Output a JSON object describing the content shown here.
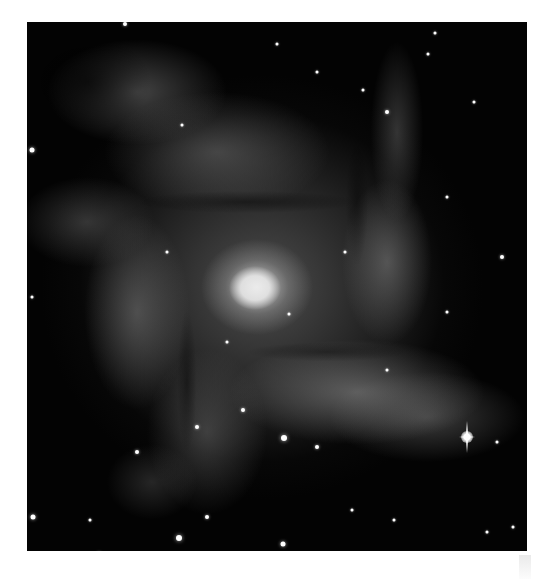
{
  "image": {
    "subject": "spiral galaxy (grayscale astronomical photograph)",
    "colors": {
      "background": "#ffffff",
      "sky": "#030303",
      "core": "#ffffff",
      "arms": "#8c8c8c"
    },
    "frame": {
      "x": 27,
      "y": 22,
      "width": 500,
      "height": 529
    },
    "core_center": {
      "x": 228,
      "y": 266
    },
    "bright_star": {
      "x": 440,
      "y": 415
    },
    "stars": [
      {
        "x": 98,
        "y": 2,
        "r": 2
      },
      {
        "x": 5,
        "y": 128,
        "r": 2.5
      },
      {
        "x": 155,
        "y": 103,
        "r": 1.5
      },
      {
        "x": 250,
        "y": 22,
        "r": 1.5
      },
      {
        "x": 408,
        "y": 11,
        "r": 1.5
      },
      {
        "x": 401,
        "y": 32,
        "r": 1.5
      },
      {
        "x": 336,
        "y": 68,
        "r": 1.5
      },
      {
        "x": 360,
        "y": 90,
        "r": 2
      },
      {
        "x": 290,
        "y": 50,
        "r": 1.5
      },
      {
        "x": 475,
        "y": 235,
        "r": 2
      },
      {
        "x": 5,
        "y": 275,
        "r": 1.5
      },
      {
        "x": 110,
        "y": 430,
        "r": 2
      },
      {
        "x": 170,
        "y": 405,
        "r": 2
      },
      {
        "x": 216,
        "y": 388,
        "r": 2
      },
      {
        "x": 257,
        "y": 416,
        "r": 3
      },
      {
        "x": 6,
        "y": 495,
        "r": 2.5
      },
      {
        "x": 63,
        "y": 498,
        "r": 1.5
      },
      {
        "x": 72,
        "y": 532,
        "r": 2
      },
      {
        "x": 152,
        "y": 516,
        "r": 3
      },
      {
        "x": 256,
        "y": 522,
        "r": 2.5
      },
      {
        "x": 180,
        "y": 495,
        "r": 2
      },
      {
        "x": 290,
        "y": 425,
        "r": 2
      },
      {
        "x": 325,
        "y": 488,
        "r": 1.5
      },
      {
        "x": 367,
        "y": 498,
        "r": 1.5
      },
      {
        "x": 460,
        "y": 510,
        "r": 1.5
      },
      {
        "x": 486,
        "y": 505,
        "r": 1.5
      },
      {
        "x": 318,
        "y": 230,
        "r": 1.5
      },
      {
        "x": 420,
        "y": 175,
        "r": 1.5
      },
      {
        "x": 447,
        "y": 80,
        "r": 1.5
      },
      {
        "x": 470,
        "y": 420,
        "r": 1.5
      },
      {
        "x": 262,
        "y": 292,
        "r": 1.5
      },
      {
        "x": 200,
        "y": 320,
        "r": 1.5
      },
      {
        "x": 140,
        "y": 230,
        "r": 1.5
      },
      {
        "x": 420,
        "y": 290,
        "r": 1.5
      },
      {
        "x": 360,
        "y": 348,
        "r": 1.5
      }
    ]
  }
}
